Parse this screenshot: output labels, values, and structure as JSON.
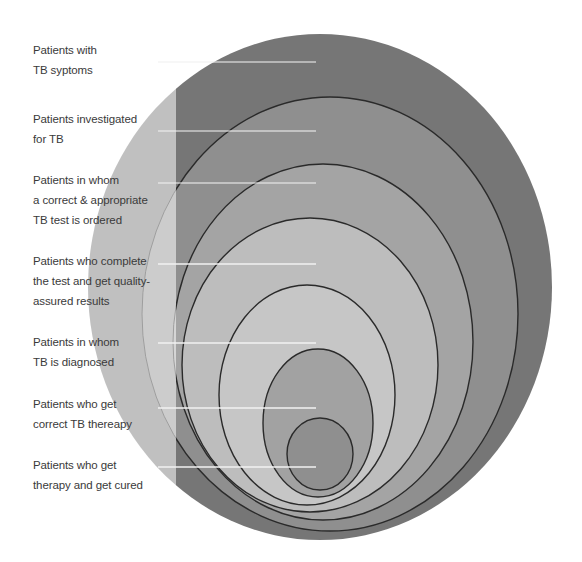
{
  "diagram": {
    "type": "nested-circles-cascade",
    "levels": [
      {
        "label": "Patients with\nTB syptoms",
        "color": "#767676",
        "cx": 320,
        "cy": 287,
        "rx": 232,
        "ry": 253,
        "label_top": 40,
        "line_y": 62
      },
      {
        "label": "Patients investigated\nfor TB",
        "color": "#8f8f8f",
        "cx": 330,
        "cy": 314,
        "rx": 188,
        "ry": 217,
        "label_top": 109,
        "line_y": 131
      },
      {
        "label": "Patients in whom\na correct & appropriate\nTB test is ordered",
        "color": "#a4a4a4",
        "cx": 323,
        "cy": 342,
        "rx": 150,
        "ry": 178,
        "label_top": 170,
        "line_y": 183
      },
      {
        "label": "Patients who complete\nthe test and get quality-\nassured results",
        "color": "#bdbdbd",
        "cx": 310,
        "cy": 365,
        "rx": 128,
        "ry": 147,
        "label_top": 251,
        "line_y": 264
      },
      {
        "label": "Patients in whom\nTB is diagnosed",
        "color": "#c6c6c6",
        "cx": 307,
        "cy": 395,
        "rx": 88,
        "ry": 110,
        "label_top": 332,
        "line_y": 343
      },
      {
        "label": "Patients who get\ncorrect TB thereapy",
        "color": "#a2a2a2",
        "cx": 318,
        "cy": 423,
        "rx": 55,
        "ry": 74,
        "label_top": 394,
        "line_y": 408
      },
      {
        "label": "Patients who get\ntherapy and get cured",
        "color": "#8f8f8f",
        "cx": 320,
        "cy": 454,
        "rx": 33,
        "ry": 36,
        "label_top": 455,
        "line_y": 467
      }
    ],
    "fade_boundary_x": 176,
    "leader_line_x1": 158,
    "leader_line_x2": 316,
    "outline_color": "#2a2a2a",
    "leader_color": "#f2f2f2"
  }
}
